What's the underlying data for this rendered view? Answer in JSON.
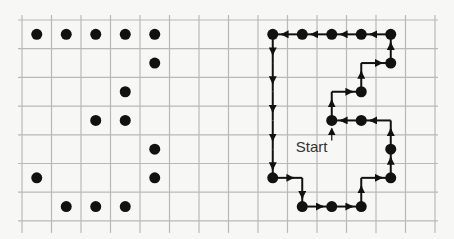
{
  "figure": {
    "grid": {
      "x0": 22,
      "y0": 20,
      "col_spacing": 29.5,
      "row_spacing": 28.7,
      "cols": 14,
      "rows": 7,
      "line_color": "#b9b9b9"
    },
    "left_pattern": {
      "description": "Dot pattern forming the digit-like shape",
      "dots": [
        [
          0,
          0
        ],
        [
          1,
          0
        ],
        [
          2,
          0
        ],
        [
          3,
          0
        ],
        [
          4,
          0
        ],
        [
          4,
          1
        ],
        [
          3,
          2
        ],
        [
          2,
          3
        ],
        [
          3,
          3
        ],
        [
          4,
          4
        ],
        [
          0,
          5
        ],
        [
          4,
          5
        ],
        [
          1,
          6
        ],
        [
          2,
          6
        ],
        [
          3,
          6
        ]
      ]
    },
    "right_trace": {
      "start_label": "Start",
      "start_cell": [
        10,
        3
      ],
      "dots": [
        [
          8,
          0
        ],
        [
          9,
          0
        ],
        [
          10,
          0
        ],
        [
          11,
          0
        ],
        [
          12,
          0
        ],
        [
          12,
          1
        ],
        [
          11,
          2
        ],
        [
          10,
          3
        ],
        [
          11,
          3
        ],
        [
          12,
          4
        ],
        [
          8,
          5
        ],
        [
          12,
          5
        ],
        [
          9,
          6
        ],
        [
          10,
          6
        ],
        [
          11,
          6
        ]
      ],
      "path": [
        [
          10,
          3
        ],
        [
          10,
          2
        ],
        [
          11,
          2
        ],
        [
          11,
          1
        ],
        [
          12,
          1
        ],
        [
          12,
          0
        ],
        [
          11,
          0
        ],
        [
          10,
          0
        ],
        [
          9,
          0
        ],
        [
          8,
          0
        ],
        [
          8,
          1
        ],
        [
          8,
          2
        ],
        [
          8,
          3
        ],
        [
          8,
          4
        ],
        [
          8,
          5
        ],
        [
          9,
          5
        ],
        [
          9,
          6
        ],
        [
          10,
          6
        ],
        [
          11,
          6
        ],
        [
          11,
          5
        ],
        [
          12,
          5
        ],
        [
          12,
          4
        ],
        [
          12,
          3
        ],
        [
          11,
          3
        ],
        [
          10,
          3
        ]
      ]
    },
    "colors": {
      "ink": "#111111",
      "label": "#333333",
      "background": "#f7f7f5"
    }
  }
}
